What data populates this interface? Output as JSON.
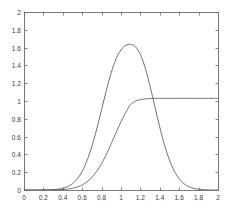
{
  "chart_data": {
    "type": "line",
    "title": "",
    "xlabel": "",
    "ylabel": "",
    "xlim": [
      0,
      2
    ],
    "ylim": [
      0,
      2
    ],
    "grid": false,
    "legend": "none",
    "box": true,
    "xticks": [
      "0",
      "0.2",
      "0.4",
      "0.6",
      "0.8",
      "1",
      "1.2",
      "1.4",
      "1.6",
      "1.8",
      "2"
    ],
    "xtick_values": [
      0,
      0.2,
      0.4,
      0.6,
      0.8,
      1,
      1.2,
      1.4,
      1.6,
      1.8,
      2
    ],
    "yticks": [
      "0",
      "0.2",
      "0.4",
      "0.6",
      "0.8",
      "1",
      "1.2",
      "1.4",
      "1.6",
      "1.8",
      "2"
    ],
    "ytick_values": [
      0,
      0.2,
      0.4,
      0.6,
      0.8,
      1,
      1.2,
      1.4,
      1.6,
      1.8,
      2
    ],
    "series": [
      {
        "name": "gaussian-pdf",
        "color": "#4d4d4d",
        "linewidth": 0.8,
        "linestyle": "solid",
        "peak_x": 1.1,
        "peak_y": 1.97,
        "x": [
          0.0,
          0.05,
          0.1,
          0.15,
          0.2,
          0.25,
          0.3,
          0.35,
          0.4,
          0.45,
          0.5,
          0.55,
          0.6,
          0.65,
          0.7,
          0.75,
          0.8,
          0.85,
          0.9,
          0.95,
          1.0,
          1.05,
          1.1,
          1.15,
          1.2,
          1.25,
          1.3,
          1.35,
          1.4,
          1.45,
          1.5,
          1.55,
          1.6,
          1.65,
          1.7,
          1.75,
          1.8,
          1.85,
          1.9,
          1.95,
          2.0
        ],
        "y": [
          0.0,
          0.0,
          0.0,
          0.0,
          0.001,
          0.002,
          0.004,
          0.009,
          0.019,
          0.038,
          0.071,
          0.126,
          0.21,
          0.331,
          0.491,
          0.686,
          0.904,
          1.124,
          1.322,
          1.476,
          1.576,
          1.625,
          1.636,
          1.608,
          1.522,
          1.37,
          1.165,
          0.933,
          0.704,
          0.501,
          0.336,
          0.212,
          0.126,
          0.07,
          0.037,
          0.018,
          0.008,
          0.004,
          0.001,
          0.0,
          0.0
        ]
      },
      {
        "name": "sigmoid-cdf",
        "color": "#555555",
        "linewidth": 0.8,
        "linestyle": "solid",
        "plateau_y": 1.03,
        "x": [
          0.0,
          0.05,
          0.1,
          0.15,
          0.2,
          0.25,
          0.3,
          0.35,
          0.4,
          0.45,
          0.5,
          0.55,
          0.6,
          0.65,
          0.7,
          0.75,
          0.8,
          0.85,
          0.9,
          0.95,
          1.0,
          1.05,
          1.1,
          1.15,
          1.2,
          1.25,
          1.3,
          1.35,
          1.4,
          1.45,
          1.5,
          1.55,
          1.6,
          1.65,
          1.7,
          1.75,
          1.8,
          1.85,
          1.9,
          1.95,
          2.0
        ],
        "y": [
          0.0,
          0.0,
          0.0,
          0.0,
          0.0,
          0.001,
          0.001,
          0.003,
          0.005,
          0.01,
          0.019,
          0.034,
          0.057,
          0.092,
          0.142,
          0.21,
          0.297,
          0.402,
          0.521,
          0.646,
          0.767,
          0.874,
          0.96,
          1.0,
          1.015,
          1.024,
          1.028,
          1.029,
          1.03,
          1.03,
          1.03,
          1.03,
          1.03,
          1.03,
          1.03,
          1.03,
          1.03,
          1.03,
          1.03,
          1.03,
          1.03
        ]
      }
    ],
    "annotations": {
      "crossing_point": {
        "x": 1.38,
        "y": 0.93
      }
    }
  },
  "style": {
    "axis_color": "#6b6b6b",
    "tick_color": "#6b6b6b",
    "text_color": "#3a3a3a",
    "background": "#ffffff"
  }
}
